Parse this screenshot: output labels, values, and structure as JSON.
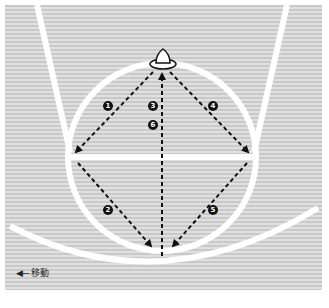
{
  "diagram": {
    "colors": {
      "court_light": "#e0e0e0",
      "court_dark": "#c9c9c9",
      "lines": "#ffffff",
      "arrows": "#111111",
      "background": "#ffffff"
    },
    "steps": [
      {
        "number": "1",
        "label": "❶",
        "from": "cone-top",
        "to": "left-elbow"
      },
      {
        "number": "2",
        "label": "❷",
        "from": "left-elbow",
        "to": "circle-bottom"
      },
      {
        "number": "3",
        "label": "❸",
        "from": "circle-bottom",
        "to": "cone-top"
      },
      {
        "number": "4",
        "label": "❹",
        "from": "cone-top",
        "to": "right-elbow"
      },
      {
        "number": "5",
        "label": "❺",
        "from": "right-elbow",
        "to": "circle-bottom"
      },
      {
        "number": "6",
        "label": "❻",
        "from": "circle-bottom",
        "to": "cone-top"
      }
    ],
    "markers": [
      {
        "type": "cone",
        "position": "top-of-circle"
      }
    ]
  },
  "legend": {
    "arrow_symbol": "◀---",
    "label": "移動"
  }
}
